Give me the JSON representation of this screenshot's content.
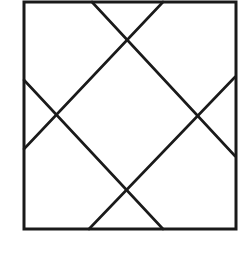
{
  "diagram": {
    "stroke_color": "#1a1a1a",
    "background": "#ffffff",
    "outer_square": {
      "x1": 24,
      "y1": 2,
      "x2": 236,
      "y2": 229
    },
    "lines": [
      {
        "id": "diag-top-left-to-right-down",
        "x1": 92,
        "y1": 2,
        "x2": 235,
        "y2": 156
      },
      {
        "id": "diag-top-right-to-left-down",
        "x1": 163,
        "y1": 2,
        "x2": 24,
        "y2": 149
      },
      {
        "id": "diag-left-to-bottom-right",
        "x1": 24,
        "y1": 80,
        "x2": 163,
        "y2": 229
      },
      {
        "id": "diag-bottom-left-to-right-up",
        "x1": 89,
        "y1": 229,
        "x2": 235,
        "y2": 77
      }
    ],
    "intersections": [
      {
        "x": 127,
        "y": 41
      },
      {
        "x": 58,
        "y": 115
      },
      {
        "x": 196,
        "y": 114
      },
      {
        "x": 126,
        "y": 189
      }
    ]
  }
}
